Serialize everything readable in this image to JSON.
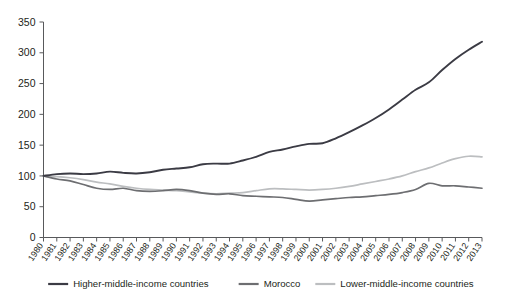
{
  "top_note": "",
  "chart_data": {
    "type": "line",
    "title": "",
    "subtitle": "",
    "xlabel": "",
    "ylabel": "",
    "ylim": [
      0,
      350
    ],
    "yticks": [
      0,
      50,
      100,
      150,
      200,
      250,
      300,
      350
    ],
    "grid": false,
    "legend_position": "bottom",
    "x": [
      1980,
      1981,
      1982,
      1983,
      1984,
      1985,
      1986,
      1987,
      1988,
      1989,
      1990,
      1991,
      1992,
      1993,
      1994,
      1995,
      1996,
      1997,
      1998,
      1999,
      2000,
      2001,
      2002,
      2003,
      2004,
      2005,
      2006,
      2007,
      2008,
      2009,
      2010,
      2011,
      2012,
      2013
    ],
    "categories": [
      "1980",
      "1981",
      "1982",
      "1983",
      "1984",
      "1985",
      "1986",
      "1987",
      "1988",
      "1989",
      "1990",
      "1991",
      "1992",
      "1993",
      "1994",
      "1995",
      "1996",
      "1997",
      "1998",
      "1999",
      "2000",
      "2001",
      "2002",
      "2003",
      "2004",
      "2005",
      "2006",
      "2007",
      "2008",
      "2009",
      "2010",
      "2011",
      "2012",
      "2013"
    ],
    "series": [
      {
        "name": "Higher-middle-income countries",
        "color": "#3b3b44",
        "values": [
          100,
          103,
          104,
          103,
          104,
          107,
          105,
          104,
          106,
          110,
          112,
          114,
          119,
          120,
          120,
          125,
          131,
          139,
          143,
          148,
          152,
          153,
          161,
          171,
          182,
          194,
          208,
          224,
          240,
          252,
          272,
          290,
          305,
          318
        ]
      },
      {
        "name": "Morocco",
        "color": "#6d6e71",
        "values": [
          100,
          95,
          92,
          86,
          80,
          78,
          80,
          76,
          75,
          76,
          78,
          76,
          72,
          70,
          71,
          68,
          67,
          66,
          65,
          62,
          59,
          61,
          63,
          65,
          66,
          68,
          70,
          73,
          78,
          88,
          84,
          84,
          82,
          80
        ]
      },
      {
        "name": "Lower-middle-income countries",
        "color": "#bcbec0",
        "values": [
          100,
          99,
          97,
          94,
          90,
          87,
          83,
          80,
          78,
          77,
          76,
          74,
          72,
          71,
          72,
          73,
          76,
          79,
          79,
          78,
          77,
          78,
          80,
          83,
          87,
          91,
          95,
          100,
          107,
          113,
          121,
          128,
          132,
          131
        ]
      }
    ]
  },
  "legend": {
    "items": [
      {
        "label": "Higher-middle-income countries",
        "color": "#3b3b44"
      },
      {
        "label": "Morocco",
        "color": "#6d6e71"
      },
      {
        "label": "Lower-middle-income countries",
        "color": "#bcbec0"
      }
    ]
  }
}
